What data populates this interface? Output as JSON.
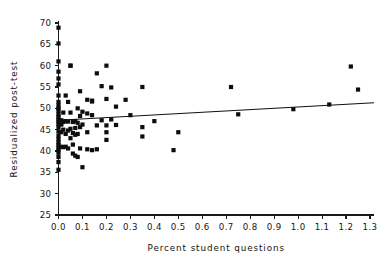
{
  "chart_data": {
    "type": "scatter",
    "title": "",
    "xlabel": "Percent student questions",
    "ylabel": "Residualized post-test",
    "xlim": [
      0.0,
      1.3
    ],
    "ylim": [
      25,
      70
    ],
    "xticks": [
      "0.0",
      "0.1",
      "0.2",
      "0.3",
      "0.4",
      "0.5",
      "0.6",
      "0.7",
      "0.8",
      "0.9",
      "1.0",
      "1.1",
      "1.2",
      "1.3"
    ],
    "xtick_values": [
      0.0,
      0.1,
      0.2,
      0.3,
      0.4,
      0.5,
      0.6,
      0.7,
      0.8,
      0.9,
      1.0,
      1.1,
      1.2,
      1.3
    ],
    "yticks": [
      "25",
      "30",
      "35",
      "40",
      "45",
      "50",
      "55",
      "60",
      "65",
      "70"
    ],
    "ytick_values": [
      25,
      30,
      35,
      40,
      45,
      50,
      55,
      60,
      65,
      70
    ],
    "grid": false,
    "legend": "none",
    "marker": "filled-square",
    "marker_size": 2.1,
    "points": [
      [
        0.0,
        68.9
      ],
      [
        0.0,
        65.2
      ],
      [
        0.0,
        61.0
      ],
      [
        0.0,
        58.6
      ],
      [
        0.0,
        57.0
      ],
      [
        0.0,
        55.6
      ],
      [
        0.0,
        53.0
      ],
      [
        0.0,
        51.5
      ],
      [
        0.0,
        50.6
      ],
      [
        0.0,
        50.0
      ],
      [
        0.0,
        49.4
      ],
      [
        0.0,
        48.6
      ],
      [
        0.0,
        48.0
      ],
      [
        0.0,
        47.4
      ],
      [
        0.0,
        46.9
      ],
      [
        0.0,
        46.3
      ],
      [
        0.0,
        45.6
      ],
      [
        0.0,
        44.6
      ],
      [
        0.0,
        43.6
      ],
      [
        0.0,
        42.8
      ],
      [
        0.0,
        42.0
      ],
      [
        0.0,
        41.4
      ],
      [
        0.0,
        40.8
      ],
      [
        0.0,
        40.2
      ],
      [
        0.0,
        39.6
      ],
      [
        0.0,
        38.6
      ],
      [
        0.0,
        37.4
      ],
      [
        0.0,
        35.6
      ],
      [
        0.012,
        47.2
      ],
      [
        0.012,
        46.2
      ],
      [
        0.012,
        44.4
      ],
      [
        0.012,
        41.0
      ],
      [
        0.02,
        49.0
      ],
      [
        0.02,
        46.8
      ],
      [
        0.02,
        45.0
      ],
      [
        0.02,
        40.9
      ],
      [
        0.03,
        53.0
      ],
      [
        0.03,
        47.0
      ],
      [
        0.03,
        44.0
      ],
      [
        0.03,
        41.0
      ],
      [
        0.04,
        51.5
      ],
      [
        0.04,
        46.9
      ],
      [
        0.04,
        44.8
      ],
      [
        0.04,
        40.6
      ],
      [
        0.05,
        60.0
      ],
      [
        0.05,
        60.0
      ],
      [
        0.05,
        49.0
      ],
      [
        0.05,
        45.2
      ],
      [
        0.05,
        43.0
      ],
      [
        0.06,
        46.8
      ],
      [
        0.06,
        44.2
      ],
      [
        0.06,
        41.5
      ],
      [
        0.06,
        39.4
      ],
      [
        0.07,
        47.0
      ],
      [
        0.07,
        45.4
      ],
      [
        0.07,
        43.8
      ],
      [
        0.07,
        38.9
      ],
      [
        0.08,
        50.0
      ],
      [
        0.08,
        46.6
      ],
      [
        0.08,
        44.0
      ],
      [
        0.08,
        38.6
      ],
      [
        0.09,
        54.0
      ],
      [
        0.09,
        48.2
      ],
      [
        0.09,
        45.6
      ],
      [
        0.09,
        40.6
      ],
      [
        0.1,
        49.2
      ],
      [
        0.1,
        46.2
      ],
      [
        0.1,
        36.2
      ],
      [
        0.12,
        52.0
      ],
      [
        0.12,
        48.8
      ],
      [
        0.12,
        44.4
      ],
      [
        0.12,
        40.4
      ],
      [
        0.14,
        51.8
      ],
      [
        0.14,
        51.6
      ],
      [
        0.14,
        48.4
      ],
      [
        0.14,
        40.2
      ],
      [
        0.16,
        58.2
      ],
      [
        0.16,
        46.0
      ],
      [
        0.16,
        40.4
      ],
      [
        0.18,
        55.2
      ],
      [
        0.18,
        47.2
      ],
      [
        0.2,
        60.0
      ],
      [
        0.2,
        52.2
      ],
      [
        0.2,
        46.0
      ],
      [
        0.2,
        44.4
      ],
      [
        0.2,
        42.6
      ],
      [
        0.22,
        54.9
      ],
      [
        0.22,
        47.4
      ],
      [
        0.24,
        50.4
      ],
      [
        0.24,
        46.1
      ],
      [
        0.28,
        52.0
      ],
      [
        0.3,
        48.4
      ],
      [
        0.35,
        55.0
      ],
      [
        0.35,
        45.6
      ],
      [
        0.35,
        43.4
      ],
      [
        0.4,
        47.0
      ],
      [
        0.48,
        40.2
      ],
      [
        0.5,
        44.4
      ],
      [
        0.72,
        55.0
      ],
      [
        0.75,
        48.6
      ],
      [
        0.98,
        49.8
      ],
      [
        1.13,
        50.9
      ],
      [
        1.22,
        59.8
      ],
      [
        1.25,
        54.4
      ]
    ],
    "fit_line": {
      "label": "regression-line",
      "x_start": 0.0,
      "y_start": 47.2,
      "x_end": 1.3,
      "y_end": 51.3
    }
  }
}
